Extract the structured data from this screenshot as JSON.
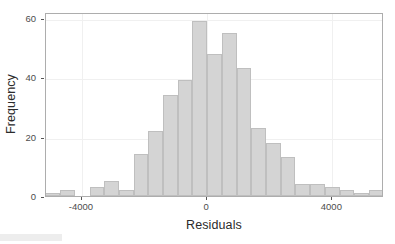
{
  "chart_data": {
    "type": "bar",
    "title": "",
    "subtitle": "",
    "xlabel": "Residuals",
    "ylabel": "Frequency",
    "xlim": [
      -5150,
      5650
    ],
    "ylim": [
      0,
      62
    ],
    "grid": true,
    "legend": null,
    "bin_width": 470,
    "x_ticks": [
      -4000,
      0,
      4000
    ],
    "x_tick_labels": [
      "-4000",
      "0",
      "4000"
    ],
    "y_ticks": [
      0,
      20,
      40,
      60
    ],
    "y_tick_labels": [
      "0",
      "20",
      "40",
      "60"
    ],
    "bar_fill_color": "#d4d4d4",
    "bar_border_color": "#bfbfbf",
    "panel_border_color": "#adadad",
    "grid_color": "#f0f0f0",
    "bin_centers": [
      -4935,
      -4465,
      -3995,
      -3525,
      -3055,
      -2585,
      -2115,
      -1645,
      -1175,
      -705,
      -235,
      235,
      705,
      1175,
      1645,
      2115,
      2585,
      3055,
      3525,
      3995,
      4465,
      4935,
      5405
    ],
    "categories": [
      "-4935",
      "-4465",
      "-3995",
      "-3525",
      "-3055",
      "-2585",
      "-2115",
      "-1645",
      "-1175",
      "-705",
      "-235",
      "235",
      "705",
      "1175",
      "1645",
      "2115",
      "2585",
      "3055",
      "3525",
      "3995",
      "4465",
      "4935",
      "5405"
    ],
    "values": [
      1,
      2,
      0,
      3,
      5,
      2,
      14,
      22,
      34,
      39,
      59,
      48,
      55,
      43,
      23,
      18,
      13,
      4,
      4,
      3,
      2,
      1,
      2
    ],
    "bars": [
      {
        "x0": -5170,
        "x1": -4700,
        "value": 1
      },
      {
        "x0": -4700,
        "x1": -4230,
        "value": 2
      },
      {
        "x0": -4230,
        "x1": -3760,
        "value": 0
      },
      {
        "x0": -3760,
        "x1": -3290,
        "value": 3
      },
      {
        "x0": -3290,
        "x1": -2820,
        "value": 5
      },
      {
        "x0": -2820,
        "x1": -2350,
        "value": 2
      },
      {
        "x0": -2350,
        "x1": -1880,
        "value": 14
      },
      {
        "x0": -1880,
        "x1": -1410,
        "value": 22
      },
      {
        "x0": -1410,
        "x1": -940,
        "value": 34
      },
      {
        "x0": -940,
        "x1": -470,
        "value": 39
      },
      {
        "x0": -470,
        "x1": 0,
        "value": 59
      },
      {
        "x0": 0,
        "x1": 470,
        "value": 48
      },
      {
        "x0": 470,
        "x1": 940,
        "value": 55
      },
      {
        "x0": 940,
        "x1": 1410,
        "value": 43
      },
      {
        "x0": 1410,
        "x1": 1880,
        "value": 23
      },
      {
        "x0": 1880,
        "x1": 2350,
        "value": 18
      },
      {
        "x0": 2350,
        "x1": 2820,
        "value": 13
      },
      {
        "x0": 2820,
        "x1": 3290,
        "value": 4
      },
      {
        "x0": 3290,
        "x1": 3760,
        "value": 4
      },
      {
        "x0": 3760,
        "x1": 4230,
        "value": 3
      },
      {
        "x0": 4230,
        "x1": 4700,
        "value": 2
      },
      {
        "x0": 4700,
        "x1": 5170,
        "value": 1
      },
      {
        "x0": 5170,
        "x1": 5640,
        "value": 2
      }
    ]
  },
  "axes": {
    "y_title": "Frequency",
    "x_title": "Residuals"
  }
}
